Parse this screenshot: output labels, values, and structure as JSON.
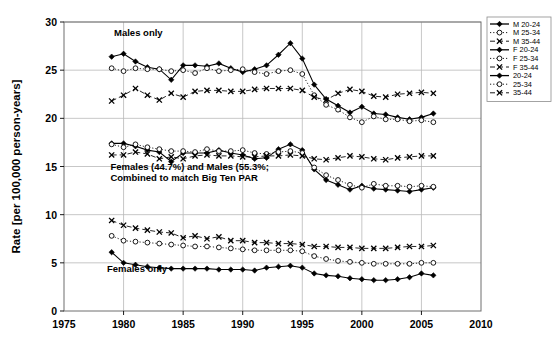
{
  "chart_data": {
    "type": "line",
    "title": "",
    "xlabel": "",
    "ylabel": "Rate [per 100,000 person-years]",
    "xlim": [
      1975,
      2010
    ],
    "ylim": [
      0,
      30
    ],
    "xticks": [
      1975,
      1980,
      1985,
      1990,
      1995,
      2000,
      2005,
      2010
    ],
    "yticks": [
      0,
      5,
      10,
      15,
      20,
      25,
      30
    ],
    "grid": true,
    "legend_position": "top-right",
    "x": [
      1979,
      1980,
      1981,
      1982,
      1983,
      1984,
      1985,
      1986,
      1987,
      1988,
      1989,
      1990,
      1991,
      1992,
      1993,
      1994,
      1995,
      1996,
      1997,
      1998,
      1999,
      2000,
      2001,
      2002,
      2003,
      2004,
      2005,
      2006
    ],
    "series": [
      {
        "name": "M 20-24",
        "marker": "filled-diamond",
        "line": "solid",
        "values": [
          26.4,
          26.7,
          25.9,
          25.3,
          25.1,
          24.0,
          25.5,
          25.5,
          25.4,
          25.7,
          25.2,
          24.8,
          25.1,
          25.5,
          26.6,
          27.8,
          26.2,
          23.5,
          22.0,
          21.3,
          20.6,
          21.2,
          20.5,
          20.4,
          20.1,
          19.9,
          20.1,
          20.5
        ]
      },
      {
        "name": "M 25-34",
        "marker": "open-circle",
        "line": "dotted",
        "values": [
          25.2,
          24.9,
          25.2,
          25.1,
          25.1,
          24.9,
          25.0,
          24.7,
          25.2,
          24.9,
          25.0,
          25.1,
          24.8,
          24.6,
          24.9,
          25.0,
          24.6,
          22.4,
          21.4,
          20.9,
          20.1,
          19.6,
          20.2,
          19.9,
          19.9,
          19.7,
          19.8,
          19.6
        ]
      },
      {
        "name": "M 35-44",
        "marker": "cross-x",
        "line": "dashed",
        "values": [
          21.8,
          22.4,
          23.1,
          22.4,
          21.9,
          22.6,
          22.2,
          22.8,
          22.9,
          22.9,
          22.8,
          22.8,
          23.0,
          23.1,
          23.1,
          23.1,
          22.9,
          22.2,
          21.9,
          22.6,
          23.0,
          22.8,
          22.3,
          22.2,
          22.5,
          22.6,
          22.7,
          22.6
        ]
      },
      {
        "name": "F 20-24",
        "marker": "filled-diamond",
        "line": "solid",
        "values": [
          17.4,
          17.4,
          17.1,
          16.7,
          16.5,
          15.5,
          16.4,
          16.4,
          16.4,
          16.7,
          16.4,
          16.2,
          15.8,
          15.9,
          16.8,
          17.3,
          16.7,
          14.7,
          13.6,
          13.1,
          12.6,
          13.0,
          12.7,
          12.6,
          12.5,
          12.4,
          12.6,
          12.8
        ]
      },
      {
        "name": "F 25-34",
        "marker": "open-circle",
        "line": "dotted",
        "values": [
          17.3,
          17.0,
          17.3,
          17.0,
          16.8,
          16.6,
          16.6,
          16.5,
          16.8,
          16.6,
          16.6,
          16.7,
          16.4,
          16.3,
          16.5,
          16.6,
          16.4,
          14.9,
          14.1,
          13.6,
          13.1,
          12.8,
          13.2,
          13.0,
          13.0,
          12.9,
          13.0,
          12.9
        ]
      },
      {
        "name": "F 35-44",
        "marker": "cross-x",
        "line": "dashed",
        "values": [
          16.2,
          16.2,
          16.5,
          16.3,
          15.8,
          16.0,
          15.8,
          16.1,
          16.2,
          16.1,
          16.1,
          16.0,
          16.0,
          16.1,
          16.1,
          16.2,
          16.1,
          15.8,
          15.7,
          15.9,
          16.1,
          16.0,
          15.8,
          15.7,
          15.9,
          16.0,
          16.1,
          16.1
        ]
      },
      {
        "name": "20-24",
        "marker": "filled-diamond",
        "line": "solid",
        "values": [
          6.1,
          5.0,
          4.8,
          4.6,
          4.5,
          4.4,
          4.4,
          4.4,
          4.4,
          4.3,
          4.3,
          4.3,
          4.2,
          4.5,
          4.6,
          4.7,
          4.5,
          3.9,
          3.7,
          3.6,
          3.4,
          3.3,
          3.2,
          3.2,
          3.3,
          3.5,
          3.9,
          3.7
        ]
      },
      {
        "name": "25-34",
        "marker": "open-circle",
        "line": "dotted",
        "values": [
          7.8,
          7.3,
          7.2,
          7.1,
          7.0,
          6.9,
          6.8,
          6.7,
          6.7,
          6.6,
          6.5,
          6.4,
          6.3,
          6.3,
          6.3,
          6.3,
          6.2,
          5.7,
          5.4,
          5.2,
          5.1,
          5.0,
          4.9,
          4.9,
          4.9,
          4.9,
          5.0,
          5.0
        ]
      },
      {
        "name": "35-44",
        "marker": "cross-x",
        "line": "dashed",
        "values": [
          9.4,
          8.9,
          8.6,
          8.4,
          8.2,
          8.1,
          7.6,
          7.8,
          7.5,
          7.7,
          7.3,
          7.3,
          7.1,
          7.1,
          7.0,
          7.0,
          6.9,
          6.7,
          6.7,
          6.6,
          6.6,
          6.5,
          6.5,
          6.5,
          6.6,
          6.7,
          6.7,
          6.8
        ]
      }
    ],
    "annotations": [
      {
        "name": "males-only",
        "text": "Males only",
        "x": 1979.2,
        "y": 28.5
      },
      {
        "name": "combined-line1",
        "text": "Females (44.7%) and Males (55.3%;",
        "x": 1978.9,
        "y": 14.6
      },
      {
        "name": "combined-line2",
        "text": "Combined to match Big Ten PAR",
        "x": 1978.9,
        "y": 13.5
      },
      {
        "name": "females-only",
        "text": "Females only",
        "x": 1978.6,
        "y": 4.0
      }
    ]
  },
  "legend": {
    "items": [
      {
        "label": "M 20-24",
        "marker": "filled-diamond",
        "line": "solid"
      },
      {
        "label": "M 25-34",
        "marker": "open-circle",
        "line": "dotted"
      },
      {
        "label": "M 35-44",
        "marker": "cross-x",
        "line": "dashed"
      },
      {
        "label": "F 20-24",
        "marker": "filled-diamond",
        "line": "solid"
      },
      {
        "label": "F 25-34",
        "marker": "open-circle",
        "line": "dotted"
      },
      {
        "label": "F 35-44",
        "marker": "cross-x",
        "line": "dashed"
      },
      {
        "label": "20-24",
        "marker": "filled-diamond",
        "line": "solid"
      },
      {
        "label": "25-34",
        "marker": "open-circle",
        "line": "dotted"
      },
      {
        "label": "35-44",
        "marker": "cross-x",
        "line": "dashed"
      }
    ]
  },
  "colors": {
    "series": "#000000",
    "grid": "#b9b9b9",
    "frame": "#6e6e6e",
    "background": "#ffffff"
  }
}
